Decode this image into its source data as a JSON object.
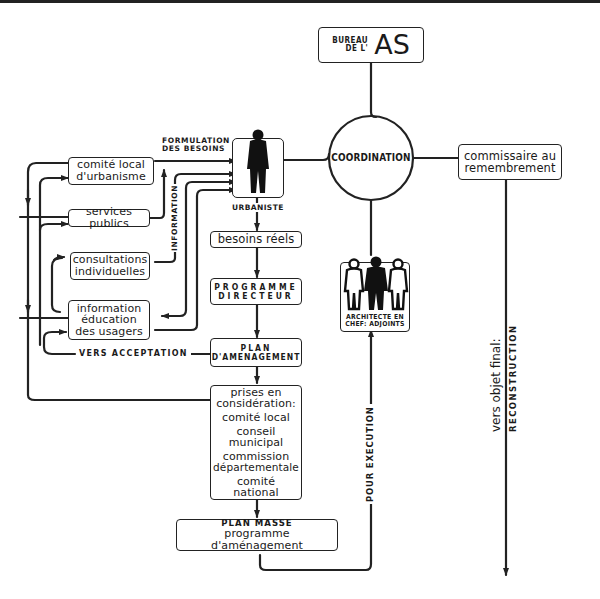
{
  "diagram": {
    "nodes": {
      "bureau": {
        "line1": "BUREAU",
        "line2": "DE L'",
        "big": "AS"
      },
      "coordination": {
        "label": "COORDINATION"
      },
      "commissaire": {
        "line1": "commissaire au",
        "line2": "remembrement"
      },
      "urbaniste": {
        "label": "URBANISTE"
      },
      "comite_local_urbanisme": {
        "line1": "comité local",
        "line2": "d'urbanisme"
      },
      "services_publics": {
        "line1": "services publics"
      },
      "consultations": {
        "line1": "consultations",
        "line2": "individuelles"
      },
      "information_usagers": {
        "line1": "information",
        "line2": "éducation",
        "line3": "des usagers"
      },
      "besoins_reels": {
        "line1": "besoins réels"
      },
      "programme_directeur": {
        "line1": "PROGRAMME",
        "line2": "DIRECTEUR"
      },
      "plan_amenagement": {
        "line1": "PLAN",
        "line2": "D'AMENAGEMENT"
      },
      "prises_en_consideration": {
        "line1": "prises en",
        "line2": "considération:",
        "line3": "comité local",
        "line4": "conseil",
        "line5": "municipal",
        "line6": "commission",
        "line7": "départementale",
        "line8": "comité",
        "line9": "national"
      },
      "plan_masse": {
        "line1": "PLAN MASSE",
        "line2": "programme d'aménagement"
      },
      "architecte": {
        "line1": "ARCHITECTE EN",
        "line2": "CHEF: ADJOINTS"
      }
    },
    "edge_labels": {
      "formulation": {
        "line1": "FORMULATION",
        "line2": "DES BESOINS"
      },
      "information": "INFORMATION",
      "vers_acceptation": "VERS ACCEPTATION",
      "pour_execution": "POUR EXECUTION",
      "vers_objet_final": "vers objet final:",
      "reconstruction": "RECONSTRUCTION"
    }
  }
}
